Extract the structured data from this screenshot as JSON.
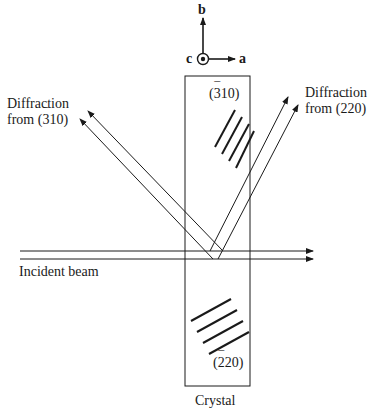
{
  "axes": {
    "a": "a",
    "b": "b",
    "c": "c"
  },
  "labels": {
    "diffraction_left_line1": "Diffraction",
    "diffraction_left_prefix": "from (",
    "diffraction_left_index_bar_digit": "3",
    "diffraction_left_index_rest": "10)",
    "diffraction_right_line1": "Diffraction",
    "diffraction_right_prefix": "from (",
    "diffraction_right_index_bar_digit": "2",
    "diffraction_right_index_rest": "20)",
    "plane_top_open": "(",
    "plane_top_bar_digit": "3",
    "plane_top_rest": "10)",
    "plane_bottom_open": "(",
    "plane_bottom_bar_digit": "2",
    "plane_bottom_rest": "20)",
    "incident_beam": "Incident beam",
    "crystal": "Crystal",
    "overbar": "¯"
  },
  "colors": {
    "line": "#1a1a1a",
    "background": "#ffffff"
  }
}
